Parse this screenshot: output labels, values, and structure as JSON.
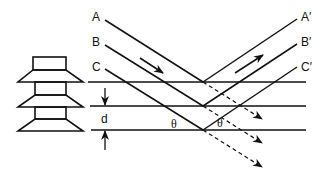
{
  "diagram": {
    "type": "bragg-diffraction",
    "colors": {
      "stroke": "#111111",
      "background": "#ffffff"
    },
    "incident_labels": [
      "A",
      "B",
      "C"
    ],
    "reflected_labels": [
      "A′",
      "B′",
      "C′"
    ],
    "spacing_label": "d",
    "angle_label_left": "θ",
    "angle_label_right": "θ",
    "planes": 3,
    "icons": {
      "crystal": "pagoda-crystal-icon"
    }
  }
}
